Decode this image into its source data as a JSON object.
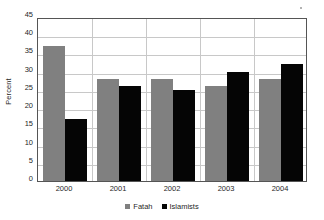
{
  "chart_data": {
    "type": "bar",
    "title": "",
    "subtitle": "",
    "xlabel": "",
    "ylabel": "Percent",
    "categories": [
      "2000",
      "2001",
      "2002",
      "2003",
      "2004"
    ],
    "series": [
      {
        "name": "Fatah",
        "color": "#808080",
        "values": [
          37,
          28,
          28,
          26,
          28
        ]
      },
      {
        "name": "Islamists",
        "color": "#050505",
        "values": [
          17,
          26,
          25,
          30,
          32
        ]
      }
    ],
    "ylim": [
      0,
      45
    ],
    "ytick_step": 5,
    "yticks": [
      "45",
      "40",
      "35",
      "30",
      "25",
      "20",
      "15",
      "10",
      "5",
      "0"
    ],
    "grid": true,
    "legend_position": "bottom"
  },
  "legend": {
    "entries": [
      {
        "label": "Fatah",
        "swatch": "gray-square-marker"
      },
      {
        "label": "Islamists",
        "swatch": "black-square-marker"
      }
    ]
  },
  "axes": {
    "y_title": "Percent"
  }
}
